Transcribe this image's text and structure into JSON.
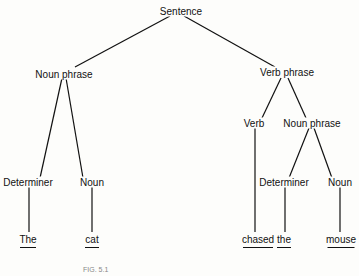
{
  "tree": {
    "root": "Sentence",
    "nodes": {
      "sentence": "Sentence",
      "np1": "Noun phrase",
      "vp": "Verb phrase",
      "det1": "Determiner",
      "noun1": "Noun",
      "verb": "Verb",
      "np2": "Noun phrase",
      "det2": "Determiner",
      "noun2": "Noun"
    },
    "words": {
      "w1": "The",
      "w2": "cat",
      "w3": "chased",
      "w4": "the",
      "w5": "mouse"
    }
  },
  "caption": "FIG. 5.1"
}
